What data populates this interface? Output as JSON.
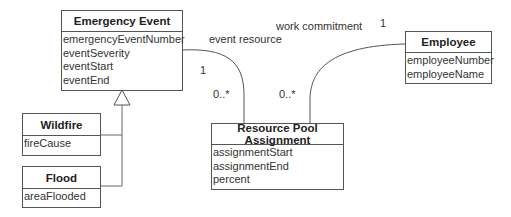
{
  "classes": {
    "emergency_event": {
      "name": "Emergency Event",
      "attributes": [
        "emergencyEventNumber",
        "eventSeverity",
        "eventStart",
        "eventEnd"
      ]
    },
    "wildfire": {
      "name": "Wildfire",
      "attributes": [
        "fireCause"
      ]
    },
    "flood": {
      "name": "Flood",
      "attributes": [
        "areaFlooded"
      ]
    },
    "resource_pool_assignment": {
      "name": "Resource Pool Assignment",
      "attributes": [
        "assignmentStart",
        "assignmentEnd",
        "percent"
      ]
    },
    "employee": {
      "name": "Employee",
      "attributes": [
        "employeeNumber",
        "employeeName"
      ]
    }
  },
  "associations": {
    "event_resource": {
      "label": "event resource",
      "mult_event": "1",
      "mult_assignment": "0..*"
    },
    "work_commitment": {
      "label": "work commitment",
      "mult_employee": "1",
      "mult_assignment": "0..*"
    }
  },
  "generalization": {
    "parent": "Emergency Event",
    "children": [
      "Wildfire",
      "Flood"
    ]
  },
  "colors": {
    "line": "#555555",
    "text": "#333333",
    "background": "#ffffff"
  }
}
